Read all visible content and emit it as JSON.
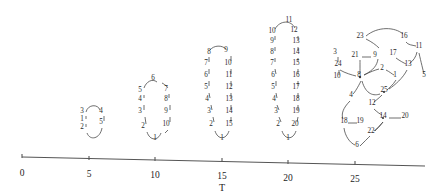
{
  "figure": {
    "title": "",
    "axis": {
      "name": "T",
      "label": "T",
      "ticks": [
        {
          "label": "0",
          "value": 0,
          "x": 22
        },
        {
          "label": "5",
          "value": 5,
          "x": 89
        },
        {
          "label": "10",
          "value": 10,
          "x": 155
        },
        {
          "label": "15",
          "value": 15,
          "x": 222
        },
        {
          "label": "20",
          "value": 20,
          "x": 288
        },
        {
          "label": "25",
          "value": 25,
          "x": 355
        }
      ],
      "line": {
        "x1": 22,
        "y1": 157,
        "x2": 425,
        "y2": 166
      }
    },
    "clusters": [
      {
        "name": "cluster-at-5",
        "center": 5,
        "nodes": [
          {
            "label": "3",
            "x": 82,
            "y": 113
          },
          {
            "label": "1",
            "x": 82,
            "y": 121
          },
          {
            "label": "2",
            "x": 82,
            "y": 129
          },
          {
            "label": "4",
            "x": 101,
            "y": 113
          },
          {
            "label": "5",
            "x": 101,
            "y": 124
          }
        ]
      },
      {
        "name": "cluster-at-10",
        "center": 10,
        "nodes": [
          {
            "label": "6",
            "x": 153,
            "y": 80
          },
          {
            "label": "5",
            "x": 140,
            "y": 92
          },
          {
            "label": "4",
            "x": 140,
            "y": 101
          },
          {
            "label": "3",
            "x": 140,
            "y": 113
          },
          {
            "label": "2",
            "x": 143,
            "y": 128
          },
          {
            "label": "7",
            "x": 166,
            "y": 91
          },
          {
            "label": "8",
            "x": 166,
            "y": 101
          },
          {
            "label": "9",
            "x": 166,
            "y": 113
          },
          {
            "label": "10",
            "x": 166,
            "y": 126
          },
          {
            "label": "1",
            "x": 155,
            "y": 140
          }
        ]
      },
      {
        "name": "cluster-at-15",
        "center": 15,
        "nodes": [
          {
            "label": "8",
            "x": 209,
            "y": 54
          },
          {
            "label": "9",
            "x": 226,
            "y": 52
          },
          {
            "label": "7",
            "x": 206,
            "y": 65
          },
          {
            "label": "10",
            "x": 228,
            "y": 65
          },
          {
            "label": "6",
            "x": 206,
            "y": 77
          },
          {
            "label": "11",
            "x": 229,
            "y": 77
          },
          {
            "label": "5",
            "x": 206,
            "y": 89
          },
          {
            "label": "12",
            "x": 229,
            "y": 89
          },
          {
            "label": "4",
            "x": 207,
            "y": 101
          },
          {
            "label": "13",
            "x": 229,
            "y": 101
          },
          {
            "label": "3",
            "x": 209,
            "y": 113
          },
          {
            "label": "14",
            "x": 229,
            "y": 113
          },
          {
            "label": "2",
            "x": 211,
            "y": 126
          },
          {
            "label": "15",
            "x": 229,
            "y": 126
          },
          {
            "label": "1",
            "x": 222,
            "y": 140
          }
        ]
      },
      {
        "name": "cluster-at-20",
        "center": 20,
        "nodes": [
          {
            "label": "11",
            "x": 289,
            "y": 22
          },
          {
            "label": "10",
            "x": 272,
            "y": 33
          },
          {
            "label": "12",
            "x": 294,
            "y": 32
          },
          {
            "label": "9",
            "x": 272,
            "y": 43
          },
          {
            "label": "13",
            "x": 296,
            "y": 43
          },
          {
            "label": "8",
            "x": 272,
            "y": 54
          },
          {
            "label": "14",
            "x": 296,
            "y": 54
          },
          {
            "label": "7",
            "x": 272,
            "y": 65
          },
          {
            "label": "15",
            "x": 296,
            "y": 65
          },
          {
            "label": "6",
            "x": 273,
            "y": 77
          },
          {
            "label": "16",
            "x": 296,
            "y": 77
          },
          {
            "label": "5",
            "x": 273,
            "y": 89
          },
          {
            "label": "17",
            "x": 296,
            "y": 89
          },
          {
            "label": "4",
            "x": 274,
            "y": 101
          },
          {
            "label": "18",
            "x": 296,
            "y": 101
          },
          {
            "label": "3",
            "x": 276,
            "y": 113
          },
          {
            "label": "19",
            "x": 296,
            "y": 113
          },
          {
            "label": "2",
            "x": 278,
            "y": 126
          },
          {
            "label": "20",
            "x": 295,
            "y": 126
          },
          {
            "label": "1",
            "x": 288,
            "y": 140
          }
        ]
      },
      {
        "name": "cluster-at-25",
        "center": 25,
        "nodes": [
          {
            "label": "23",
            "x": 360,
            "y": 38
          },
          {
            "label": "16",
            "x": 404,
            "y": 38
          },
          {
            "label": "11",
            "x": 419,
            "y": 48
          },
          {
            "label": "17",
            "x": 393,
            "y": 55
          },
          {
            "label": "13",
            "x": 408,
            "y": 66
          },
          {
            "label": "5",
            "x": 424,
            "y": 77
          },
          {
            "label": "3",
            "x": 335,
            "y": 54
          },
          {
            "label": "21",
            "x": 355,
            "y": 57
          },
          {
            "label": "9",
            "x": 375,
            "y": 57
          },
          {
            "label": "24",
            "x": 338,
            "y": 66
          },
          {
            "label": "2",
            "x": 382,
            "y": 70
          },
          {
            "label": "10",
            "x": 337,
            "y": 78
          },
          {
            "label": "8",
            "x": 359,
            "y": 77
          },
          {
            "label": "1",
            "x": 395,
            "y": 77
          },
          {
            "label": "25",
            "x": 384,
            "y": 92
          },
          {
            "label": "4",
            "x": 351,
            "y": 97
          },
          {
            "label": "12",
            "x": 372,
            "y": 105
          },
          {
            "label": "20",
            "x": 405,
            "y": 118
          },
          {
            "label": "14",
            "x": 383,
            "y": 118
          },
          {
            "label": "18",
            "x": 344,
            "y": 123
          },
          {
            "label": "19",
            "x": 360,
            "y": 123
          },
          {
            "label": "22",
            "x": 371,
            "y": 133
          },
          {
            "label": "6",
            "x": 357,
            "y": 147
          }
        ]
      }
    ]
  }
}
